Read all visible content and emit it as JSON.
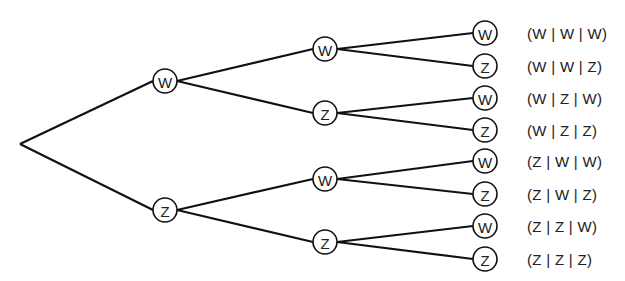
{
  "diagram": {
    "type": "tree-diagram",
    "root": {
      "x": 20,
      "y": 144
    },
    "node_radius": 12,
    "levels": [
      [
        {
          "label": "W",
          "x": 165,
          "y": 81,
          "parent": "root"
        },
        {
          "label": "Z",
          "x": 165,
          "y": 210,
          "parent": "root"
        }
      ],
      [
        {
          "label": "W",
          "x": 325,
          "y": 49,
          "parent": 0
        },
        {
          "label": "Z",
          "x": 325,
          "y": 113,
          "parent": 0
        },
        {
          "label": "W",
          "x": 325,
          "y": 179,
          "parent": 1
        },
        {
          "label": "Z",
          "x": 325,
          "y": 242,
          "parent": 1
        }
      ],
      [
        {
          "label": "W",
          "x": 485,
          "y": 33,
          "parent": 0
        },
        {
          "label": "Z",
          "x": 485,
          "y": 66,
          "parent": 0
        },
        {
          "label": "W",
          "x": 485,
          "y": 98,
          "parent": 1
        },
        {
          "label": "Z",
          "x": 485,
          "y": 130,
          "parent": 1
        },
        {
          "label": "W",
          "x": 485,
          "y": 161,
          "parent": 2
        },
        {
          "label": "Z",
          "x": 485,
          "y": 194,
          "parent": 2
        },
        {
          "label": "W",
          "x": 485,
          "y": 226,
          "parent": 3
        },
        {
          "label": "Z",
          "x": 485,
          "y": 259,
          "parent": 3
        }
      ]
    ],
    "outcomes": [
      {
        "text": "(W | W | W)",
        "y": 33
      },
      {
        "text": "(W | W | Z)",
        "y": 66
      },
      {
        "text": "(W | Z | W)",
        "y": 98
      },
      {
        "text": "(W | Z | Z)",
        "y": 130
      },
      {
        "text": "(Z | W | W)",
        "y": 161
      },
      {
        "text": "(Z | W | Z)",
        "y": 194
      },
      {
        "text": "(Z | Z | W)",
        "y": 226
      },
      {
        "text": "(Z | Z | Z)",
        "y": 259
      }
    ]
  }
}
